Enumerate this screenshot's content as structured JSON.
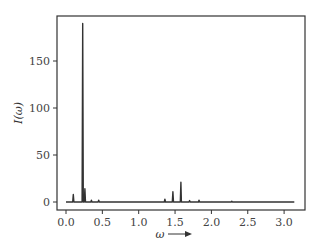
{
  "chart_data": {
    "type": "line",
    "title": "",
    "xlabel": "ω",
    "ylabel": "I(ω)",
    "xlim": [
      -0.12,
      3.28
    ],
    "ylim": [
      -8,
      205
    ],
    "x_ticks": [
      0.0,
      0.5,
      1.0,
      1.5,
      2.0,
      2.5,
      3.0
    ],
    "x_tick_labels": [
      "0.0",
      "0.5",
      "1.0",
      "1.5",
      "2.0",
      "2.5",
      "3.0"
    ],
    "y_ticks": [
      0,
      50,
      100,
      150
    ],
    "y_tick_labels": [
      "0",
      "50",
      "100",
      "150"
    ],
    "grid": false,
    "legend": null,
    "x_range": [
      0.0,
      3.14
    ],
    "baseline": 0,
    "peaks": [
      {
        "x": 0.1,
        "y": 8
      },
      {
        "x": 0.23,
        "y": 190
      },
      {
        "x": 0.26,
        "y": 14
      },
      {
        "x": 0.35,
        "y": 2
      },
      {
        "x": 0.45,
        "y": 2
      },
      {
        "x": 1.36,
        "y": 3
      },
      {
        "x": 1.47,
        "y": 11
      },
      {
        "x": 1.58,
        "y": 21
      },
      {
        "x": 1.7,
        "y": 1.5
      },
      {
        "x": 1.83,
        "y": 2
      },
      {
        "x": 2.28,
        "y": 0.8
      }
    ],
    "line_color": "#333333"
  }
}
